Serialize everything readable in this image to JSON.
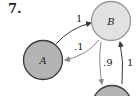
{
  "problem": {
    "number": "7."
  },
  "diagram": {
    "type": "state-transition-diagram",
    "nodes": [
      {
        "id": "A",
        "label": "A",
        "fill": "#b4b4b4",
        "stroke": "#3a3a3a"
      },
      {
        "id": "B",
        "label": "B",
        "fill": "#e2e2e2",
        "stroke": "#9a9a9a"
      },
      {
        "id": "C",
        "label": "",
        "fill": "#b4b4b4",
        "stroke": "#3a3a3a"
      }
    ],
    "edges": [
      {
        "from": "A",
        "to": "B",
        "label": "1"
      },
      {
        "from": "B",
        "to": "A",
        "label": ".1"
      },
      {
        "from": "B",
        "to": "C",
        "label": ".9"
      },
      {
        "from": "C",
        "to": "B",
        "label": "1"
      }
    ]
  }
}
